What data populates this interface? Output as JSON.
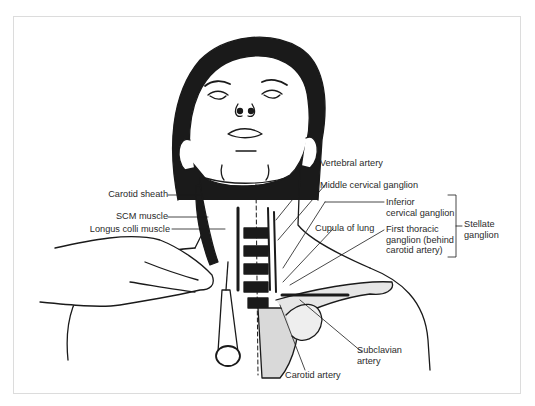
{
  "figure": {
    "labels_left": [
      {
        "id": "carotid-sheath",
        "text": "Carotid sheath"
      },
      {
        "id": "scm-muscle",
        "text": "SCM muscle"
      },
      {
        "id": "longus-colli-muscle",
        "text": "Longus colli muscle"
      }
    ],
    "labels_right": [
      {
        "id": "vertebral-artery",
        "text": "Vertebral artery"
      },
      {
        "id": "middle-cervical-ganglion",
        "text": "Middle cervical ganglion"
      },
      {
        "id": "inferior-cervical-ganglion",
        "line1": "Inferior",
        "line2": "cervical ganglion"
      },
      {
        "id": "cupula-of-lung",
        "text": "Cupula of lung"
      },
      {
        "id": "first-thoracic-ganglion",
        "line1": "First thoracic",
        "line2": "ganglion (behind",
        "line3": "carotid artery)"
      },
      {
        "id": "stellate-ganglion",
        "line1": "Stellate",
        "line2": "ganglion"
      }
    ],
    "labels_bottom": [
      {
        "id": "subclavian-artery",
        "line1": "Subclavian",
        "line2": "artery"
      },
      {
        "id": "carotid-artery",
        "text": "Carotid artery"
      }
    ],
    "colors": {
      "ink": "#1a1a1a",
      "skin": "#ffffff",
      "tissue_gray": "#d9d9d9",
      "frame": "#dcdcdc",
      "text": "#2a2a2a"
    }
  }
}
